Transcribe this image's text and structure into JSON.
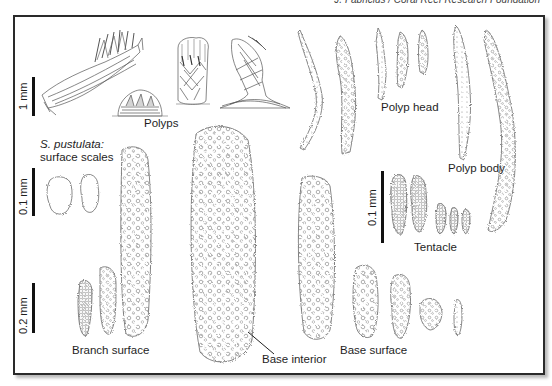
{
  "credit": "J. Fabricius / Coral Reef Research Foundation",
  "figure": {
    "subject_species": "S. pustulata:",
    "groups": [
      {
        "id": "polyps",
        "label": "Polyps",
        "scale": "1 mm"
      },
      {
        "id": "polyp_head",
        "label": "Polyp head"
      },
      {
        "id": "polyp_body",
        "label": "Polyp body"
      },
      {
        "id": "surface_scales",
        "label": "surface scales",
        "scale": "0.1 mm"
      },
      {
        "id": "tentacle",
        "label": "Tentacle",
        "scale": "0.1 mm"
      },
      {
        "id": "branch_surface",
        "label": "Branch surface",
        "scale": "0.2 mm"
      },
      {
        "id": "base_interior",
        "label": "Base interior"
      },
      {
        "id": "base_surface",
        "label": "Base surface"
      }
    ]
  },
  "scale_bars": {
    "polyps": "1 mm",
    "scales": "0.1 mm",
    "sclerites": "0.2 mm",
    "tentacle": "0.1 mm"
  },
  "labels": {
    "polyps": "Polyps",
    "polyp_head": "Polyp head",
    "polyp_body": "Polyp body",
    "species": "S. pustulata:",
    "surface_scales": "surface scales",
    "tentacle": "Tentacle",
    "branch_surface": "Branch surface",
    "base_interior": "Base interior",
    "base_surface": "Base surface"
  },
  "colors": {
    "line": "#555555",
    "frame": "#2a2a2a",
    "background": "#ffffff"
  }
}
